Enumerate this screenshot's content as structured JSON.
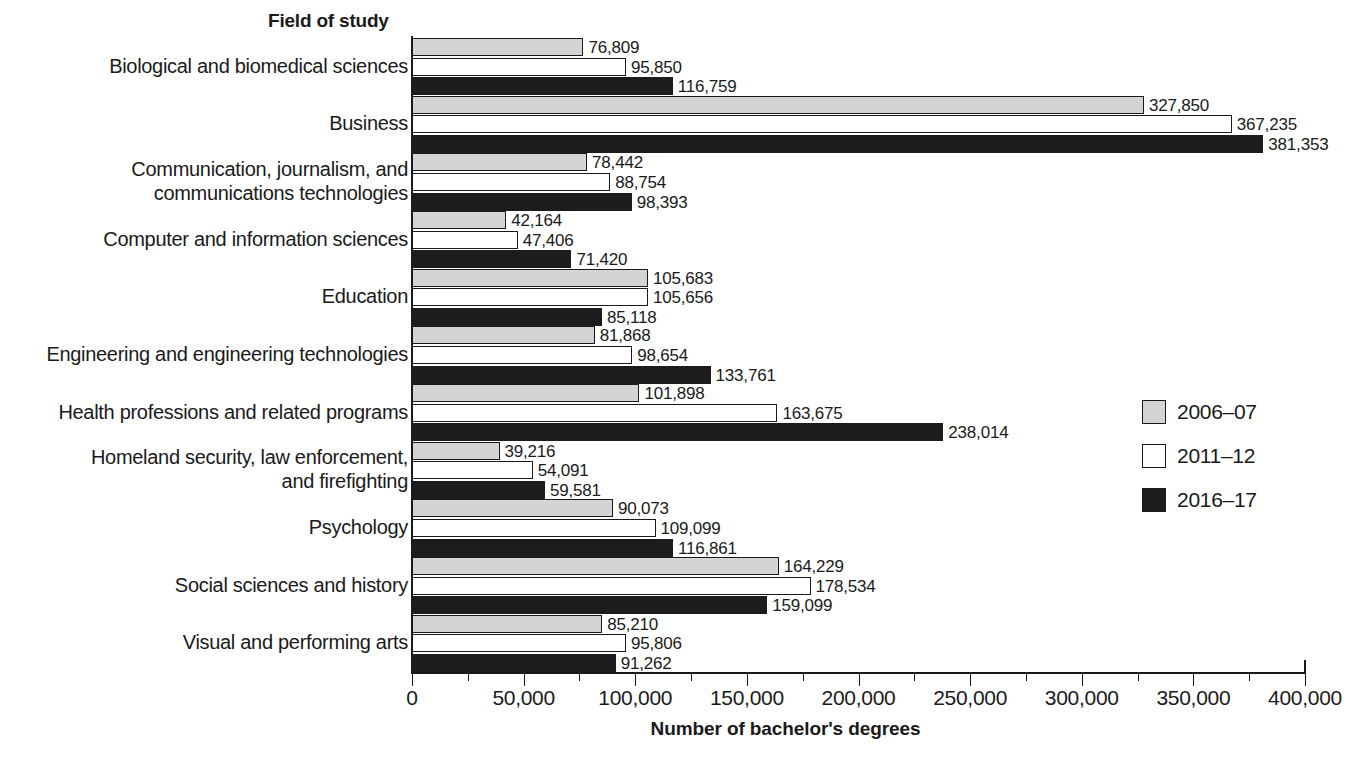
{
  "chart_data": {
    "type": "bar",
    "orientation": "horizontal",
    "title": "Field of study",
    "xlabel": "Number of bachelor's degrees",
    "ylabel": "Field of study",
    "xlim": [
      0,
      400000
    ],
    "xticks": [
      0,
      50000,
      100000,
      150000,
      200000,
      250000,
      300000,
      350000,
      400000
    ],
    "xtick_labels": [
      "0",
      "50,000",
      "100,000",
      "150,000",
      "200,000",
      "250,000",
      "300,000",
      "350,000",
      "400,000"
    ],
    "minor_tick_step": 25000,
    "grid": false,
    "legend_position": "right",
    "categories": [
      "Biological and biomedical sciences",
      "Business",
      "Communication, journalism, and\ncommunications technologies",
      "Computer and information sciences",
      "Education",
      "Engineering and engineering technologies",
      "Health professions and related programs",
      "Homeland security, law enforcement,\nand firefighting",
      "Psychology",
      "Social sciences and history",
      "Visual and performing arts"
    ],
    "series": [
      {
        "name": "2006–07",
        "color": "#d4d4d4",
        "values": [
          76809,
          327850,
          78442,
          42164,
          105683,
          81868,
          101898,
          39216,
          90073,
          164229,
          85210
        ],
        "labels": [
          "76,809",
          "327,850",
          "78,442",
          "42,164",
          "105,683",
          "81,868",
          "101,898",
          "39,216",
          "90,073",
          "164,229",
          "85,210"
        ]
      },
      {
        "name": "2011–12",
        "color": "#ffffff",
        "values": [
          95850,
          367235,
          88754,
          47406,
          105656,
          98654,
          163675,
          54091,
          109099,
          178534,
          95806
        ],
        "labels": [
          "95,850",
          "367,235",
          "88,754",
          "47,406",
          "105,656",
          "98,654",
          "163,675",
          "54,091",
          "109,099",
          "178,534",
          "95,806"
        ]
      },
      {
        "name": "2016–17",
        "color": "#1c1c1c",
        "values": [
          116759,
          381353,
          98393,
          71420,
          85118,
          133761,
          238014,
          59581,
          116861,
          159099,
          91262
        ],
        "labels": [
          "116,759",
          "381,353",
          "98,393",
          "71,420",
          "85,118",
          "133,761",
          "238,014",
          "59,581",
          "116,861",
          "159,099",
          "91,262"
        ]
      }
    ]
  },
  "legend": {
    "items": [
      {
        "label": "2006–07",
        "swatch": "s0"
      },
      {
        "label": "2011–12",
        "swatch": "s1"
      },
      {
        "label": "2016–17",
        "swatch": "s2"
      }
    ]
  }
}
